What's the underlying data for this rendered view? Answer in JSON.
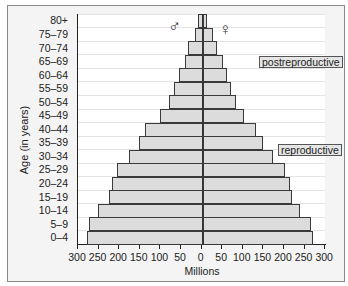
{
  "chart_data": {
    "type": "bar",
    "subtype": "population-pyramid",
    "title": "",
    "xlabel": "Millions",
    "ylabel": "Age (in years)",
    "categories": [
      "0–4",
      "5–9",
      "10–14",
      "15–19",
      "20–24",
      "25–29",
      "30–34",
      "35–39",
      "40–44",
      "45–49",
      "50–54",
      "55–59",
      "60–64",
      "65–69",
      "70–74",
      "75–79",
      "80+"
    ],
    "series": [
      {
        "name": "Male",
        "symbol": "♂",
        "side": "left",
        "values": [
          280,
          275,
          254,
          226,
          220,
          208,
          178,
          153,
          140,
          102,
          81,
          70,
          56,
          42,
          34,
          17,
          11
        ]
      },
      {
        "name": "Female",
        "symbol": "♀",
        "side": "right",
        "values": [
          268,
          264,
          236,
          216,
          213,
          200,
          171,
          146,
          129,
          101,
          82,
          70,
          60,
          50,
          34,
          25,
          12
        ]
      }
    ],
    "xticks": [
      "300",
      "250",
      "200",
      "150",
      "100",
      "50",
      "0",
      "50",
      "100",
      "150",
      "200",
      "250",
      "300"
    ],
    "xlim": [
      -300,
      300
    ],
    "annotations": [
      {
        "text": "postreproductive",
        "age_group": "65–69"
      },
      {
        "text": "reproductive",
        "age_group": "30–34"
      }
    ],
    "grid": true,
    "bar_color": "#dcdcdc",
    "edge_color": "#3a3a3a"
  },
  "labels": {
    "ylabel": "Age (in years)",
    "xlabel": "Millions",
    "male_symbol": "♂",
    "female_symbol": "♀",
    "postreproductive": "postreproductive",
    "reproductive": "reproductive"
  }
}
